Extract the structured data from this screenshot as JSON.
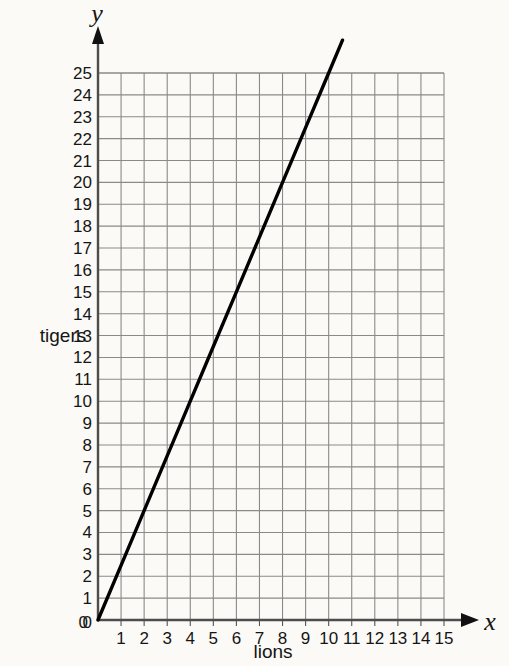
{
  "chart_data": {
    "type": "line",
    "title": "",
    "xlabel": "lions",
    "ylabel": "tigers",
    "x_axis_letter": "x",
    "y_axis_letter": "y",
    "xlim": [
      0,
      15
    ],
    "ylim": [
      0,
      25
    ],
    "x_ticks": [
      0,
      1,
      2,
      3,
      4,
      5,
      6,
      7,
      8,
      9,
      10,
      11,
      12,
      13,
      14,
      15
    ],
    "y_ticks": [
      0,
      1,
      2,
      3,
      4,
      5,
      6,
      7,
      8,
      9,
      10,
      11,
      12,
      13,
      14,
      15,
      16,
      17,
      18,
      19,
      20,
      21,
      22,
      23,
      24,
      25
    ],
    "x_tick_labels": [
      "0",
      "1",
      "2",
      "3",
      "4",
      "5",
      "6",
      "7",
      "8",
      "9",
      "10",
      "11",
      "12",
      "13",
      "14",
      "15"
    ],
    "y_tick_labels": [
      "0",
      "1",
      "2",
      "3",
      "4",
      "5",
      "6",
      "7",
      "8",
      "9",
      "10",
      "11",
      "12",
      "13",
      "14",
      "15",
      "16",
      "17",
      "18",
      "19",
      "20",
      "21",
      "22",
      "23",
      "24",
      "25"
    ],
    "grid": true,
    "grid_color": "#8a8a8a",
    "legend": null,
    "series": [
      {
        "name": "lions vs tigers",
        "color": "#000000",
        "slope": 2.5,
        "intercept": 0,
        "points": [
          {
            "x": 0,
            "y": 0
          },
          {
            "x": 1,
            "y": 2.5
          },
          {
            "x": 2,
            "y": 5
          },
          {
            "x": 3,
            "y": 7.5
          },
          {
            "x": 4,
            "y": 10
          },
          {
            "x": 5,
            "y": 12.5
          },
          {
            "x": 6,
            "y": 15
          },
          {
            "x": 7,
            "y": 17.5
          },
          {
            "x": 8,
            "y": 20
          },
          {
            "x": 9,
            "y": 22.5
          },
          {
            "x": 10,
            "y": 25
          },
          {
            "x": 10.6,
            "y": 26.5
          }
        ]
      }
    ]
  },
  "axes": {
    "y_letter": "y",
    "x_letter": "x",
    "y_title": "tigers",
    "x_title": "lions"
  }
}
